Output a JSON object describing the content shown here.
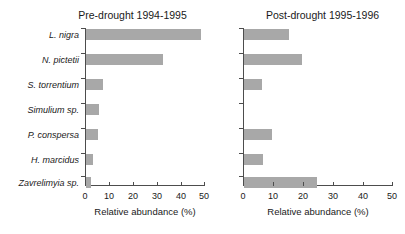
{
  "chart_data": {
    "type": "bar",
    "orientation": "horizontal",
    "title": "",
    "xlabel": "Relative abundance (%)",
    "ylabel": "",
    "xlim": [
      0,
      50
    ],
    "xticks": [
      0,
      10,
      20,
      30,
      40,
      50
    ],
    "grid": false,
    "legend": null,
    "bar_color": "#a8a8a8",
    "categories": [
      "L. nigra",
      "N. pictetii",
      "S. torrentium",
      "Simulium sp.",
      "P. conspersa",
      "H. marcidus",
      "Zavrelimyia sp."
    ],
    "panels": [
      {
        "title": "Pre-drought 1994-1995",
        "xlabel": "Relative abundance (%)",
        "values": [
          48.5,
          32.5,
          7.0,
          5.5,
          5.0,
          3.0,
          2.0
        ]
      },
      {
        "title": "Post-drought 1995-1996",
        "xlabel": "Relative abundance (%)",
        "values": [
          15.0,
          19.5,
          6.0,
          0.0,
          9.5,
          6.5,
          24.5
        ]
      }
    ]
  }
}
